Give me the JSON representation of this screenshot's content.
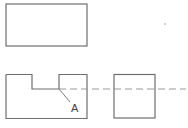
{
  "diagram": {
    "type": "orthographic-projection",
    "colors": {
      "line": "#6e6e6e",
      "dashed": "#9a9a9a",
      "background": "#ffffff"
    },
    "views": {
      "top_view": {
        "shape": "rectangle"
      },
      "front_view": {
        "shape": "rectangle-with-top-notch"
      },
      "side_view": {
        "shape": "square"
      }
    },
    "hidden_line": {
      "style": "dashed"
    },
    "annotation": {
      "label": "A"
    }
  }
}
